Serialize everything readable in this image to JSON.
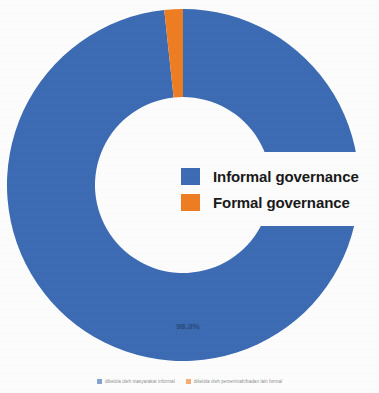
{
  "colors": {
    "informal_blue": "#3E6DB5",
    "formal_orange": "#F07F24",
    "background": "#FFFFFF",
    "label_text": "#27456F"
  },
  "chart_data": {
    "type": "pie",
    "variant": "donut",
    "title": "",
    "categories": [
      "Informal governance",
      "Formal governance"
    ],
    "values": [
      98.3,
      1.7
    ],
    "unit": "%",
    "data_labels": [
      "98.3%",
      ""
    ],
    "series": [
      {
        "name": "Governance type",
        "values": [
          98.3,
          1.7
        ]
      }
    ],
    "slices": [
      {
        "label": "Informal governance",
        "value": 98.3,
        "color": "#3E6DB5",
        "data_label": "98.3%",
        "source_label": "dikelola oleh masyarakat informal"
      },
      {
        "label": "Formal governance",
        "value": 1.7,
        "color": "#F07F24",
        "data_label": "",
        "source_label": "dikelola oleh pemerintah/badan lain formal"
      }
    ],
    "legend_position": "center-right",
    "grid": false,
    "start_angle_deg": 0,
    "hole_ratio": 0.5
  },
  "main_legend": {
    "items": [
      {
        "label": "Informal governance",
        "color": "#3E6DB5"
      },
      {
        "label": "Formal governance",
        "color": "#F07F24"
      }
    ]
  },
  "bottom_legend": {
    "items": [
      {
        "label": "dikelola oleh masyarakat informal",
        "color": "#3E6DB5"
      },
      {
        "label": "dikelola oleh pemerintah/badan lain formal",
        "color": "#F07F24"
      }
    ]
  },
  "pct_label": {
    "text": "98.3%"
  }
}
